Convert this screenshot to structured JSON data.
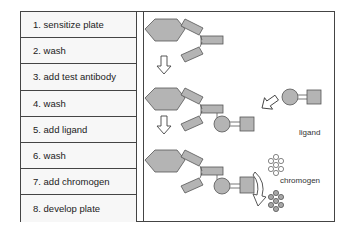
{
  "steps": [
    {
      "label": "1.  sensitize plate"
    },
    {
      "label": "2.  wash"
    },
    {
      "label": "3.  add test antibody"
    },
    {
      "label": "4.  wash"
    },
    {
      "label": "5.  add  ligand"
    },
    {
      "label": "6.  wash"
    },
    {
      "label": "7.  add chromogen"
    },
    {
      "label": "8.  develop plate"
    }
  ],
  "labels": {
    "ligand": "ligand",
    "chromogen": "chromogen"
  },
  "colors": {
    "shape_fill": "#b4b4b4",
    "outline": "#555555"
  }
}
